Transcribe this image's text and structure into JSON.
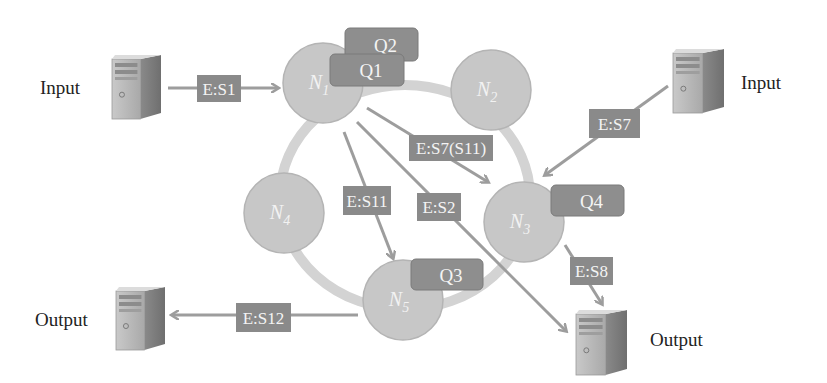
{
  "colors": {
    "background": "#ffffff",
    "ring": "#d3d3d3",
    "node_fill": "#c7c7c7",
    "node_stroke": "#b4b4b4",
    "node_text": "#f2f2f2",
    "queue_fill": "#8e8e8e",
    "queue_stroke": "#7a7a7a",
    "edge_label_fill": "#8a8a8a",
    "edge_label_text": "#f4f4f4",
    "arrow": "#9d9d9d",
    "text": "#222222"
  },
  "nodes": [
    {
      "id": "N1",
      "base": "N",
      "sub": "1",
      "cx": 323,
      "cy": 83
    },
    {
      "id": "N2",
      "base": "N",
      "sub": "2",
      "cx": 491,
      "cy": 90
    },
    {
      "id": "N3",
      "base": "N",
      "sub": "3",
      "cx": 524,
      "cy": 222
    },
    {
      "id": "N4",
      "base": "N",
      "sub": "4",
      "cx": 284,
      "cy": 213
    },
    {
      "id": "N5",
      "base": "N",
      "sub": "5",
      "cx": 403,
      "cy": 300
    }
  ],
  "queues": [
    {
      "label": "Q2",
      "x": 345,
      "y": 28,
      "w": 73,
      "h": 33
    },
    {
      "label": "Q1",
      "x": 330,
      "y": 54,
      "w": 74,
      "h": 32
    },
    {
      "label": "Q4",
      "x": 551,
      "y": 185,
      "w": 73,
      "h": 31
    },
    {
      "label": "Q3",
      "x": 411,
      "y": 259,
      "w": 72,
      "h": 31
    }
  ],
  "edge_labels": [
    {
      "label": "E:S1",
      "x": 197,
      "y": 75,
      "w": 44,
      "h": 27
    },
    {
      "label": "E:S7",
      "x": 589,
      "y": 109,
      "w": 51,
      "h": 29
    },
    {
      "label": "E:S7(S11)",
      "x": 409,
      "y": 135,
      "w": 84,
      "h": 26
    },
    {
      "label": "E:S11",
      "x": 343,
      "y": 186,
      "w": 48,
      "h": 29
    },
    {
      "label": "E:S2",
      "x": 417,
      "y": 193,
      "w": 44,
      "h": 28
    },
    {
      "label": "E:S8",
      "x": 570,
      "y": 257,
      "w": 43,
      "h": 28
    },
    {
      "label": "E:S12",
      "x": 236,
      "y": 303,
      "w": 55,
      "h": 29
    }
  ],
  "servers": [
    {
      "role": "input",
      "label": "Input",
      "x": 112,
      "y": 55,
      "w": 49,
      "h": 64,
      "label_x": 40,
      "label_y": 94
    },
    {
      "role": "input",
      "label": "Input",
      "x": 673,
      "y": 49,
      "w": 51,
      "h": 64,
      "label_x": 741,
      "label_y": 89
    },
    {
      "role": "output",
      "label": "Output",
      "x": 116,
      "y": 287,
      "w": 49,
      "h": 63,
      "label_x": 35,
      "label_y": 326
    },
    {
      "role": "output",
      "label": "Output",
      "x": 576,
      "y": 310,
      "w": 51,
      "h": 65,
      "label_x": 650,
      "label_y": 346
    }
  ]
}
